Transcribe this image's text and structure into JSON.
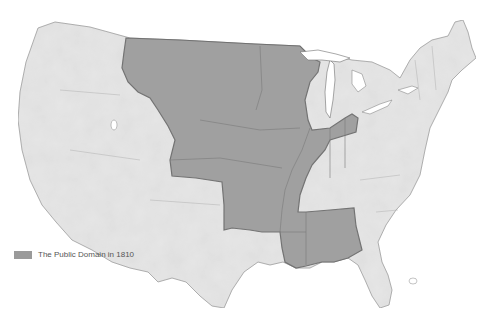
{
  "map": {
    "title": "The Public Domain in 1810",
    "colors": {
      "land": "#e6e6e6",
      "land_stroke": "#9a9a9a",
      "public_domain": "#9d9d9d",
      "public_domain_stroke": "#6e6e6e",
      "water": "#ffffff",
      "lake": "#ffffff"
    }
  },
  "legend": {
    "items": [
      {
        "label": "The Public Domain in 1810",
        "color": "#9a9a9a"
      }
    ]
  }
}
